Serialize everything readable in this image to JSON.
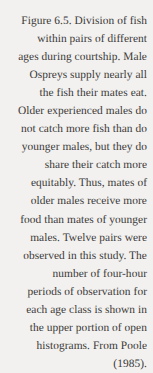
{
  "document": {
    "type": "figure-caption",
    "figure_number": "Figure 6.5.",
    "source_citation": "From Poole (1985).",
    "background_color": "#f2f1ef",
    "text_color": "#2e2c2b",
    "alignment": "right",
    "full_text": "Figure 6.5. Division of fish within pairs of different ages during courtship. Male Ospreys supply nearly all the fish their mates eat. Older experienced males do not catch more fish than do younger males, but they do share their catch more equitably. Thus, mates of older males receive more food than mates of younger males. Twelve pairs were observed in this study. The number of four-hour periods of observation for each age class is shown in the upper portion of open histograms. From Poole (1985).",
    "lines": [
      "Figure 6.5. Division of fish",
      "within pairs of different",
      "ages during courtship. Male",
      "Ospreys supply nearly all",
      "the fish their mates eat.",
      "Older experienced males do",
      "not catch more fish than do",
      "younger males, but they do",
      "share their catch more",
      "equitably. Thus, mates of",
      "older males receive more",
      "food than mates of younger",
      "males. Twelve pairs were",
      "observed in this study. The",
      "number of four-hour",
      "periods of observation for",
      "each age class is shown in",
      "the upper portion of open",
      "histograms. From Poole",
      "(1985)."
    ]
  }
}
